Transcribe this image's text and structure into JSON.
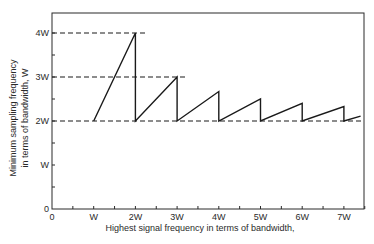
{
  "chart_data": {
    "type": "line",
    "title": "",
    "xlabel": "Highest signal frequency in terms of bandwidth,",
    "ylabel_line1": "Minimum sampling frequency",
    "ylabel_line2": "in terms of bandwidth, W",
    "x_ticks": [
      "0",
      "W",
      "2W",
      "3W",
      "4W",
      "5W",
      "6W",
      "7W"
    ],
    "y_ticks": [
      "0",
      "W",
      "2W",
      "3W",
      "4W"
    ],
    "xlim": [
      0,
      7.75
    ],
    "ylim": [
      0,
      4.45
    ],
    "grid": false,
    "series": [
      {
        "name": "Minimum sampling frequency (sawtooth)",
        "x": [
          1,
          2,
          2,
          3,
          3,
          4,
          4,
          5,
          5,
          6,
          6,
          7,
          7,
          7.4
        ],
        "y": [
          2,
          4,
          2,
          3,
          2,
          2.67,
          2,
          2.5,
          2,
          2.4,
          2,
          2.33,
          2,
          2.11
        ]
      }
    ],
    "reference_lines": [
      {
        "y": 4,
        "x_end": 2.25,
        "style": "dashed"
      },
      {
        "y": 3,
        "x_end": 3.25,
        "style": "dashed"
      },
      {
        "y": 2,
        "x_end": 7.75,
        "style": "dashed"
      }
    ]
  },
  "colors": {
    "line": "#1a1a1a",
    "axis": "#2a2a2a",
    "background": "#ffffff"
  }
}
